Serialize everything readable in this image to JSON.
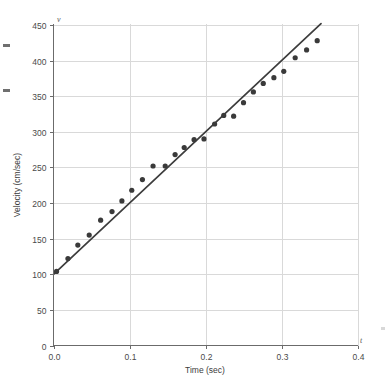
{
  "chart_data": {
    "type": "scatter",
    "title": "",
    "xlabel": "Time (sec)",
    "ylabel": "Velocity (cm/sec)",
    "x_axis_variable": "t",
    "y_axis_variable": "v",
    "xlim": [
      0.0,
      0.4
    ],
    "ylim": [
      0,
      450
    ],
    "xticks": [
      0.0,
      0.1,
      0.2,
      0.3,
      0.4
    ],
    "xtick_labels": [
      "0.0",
      "0.1",
      "0.2",
      "0.3",
      "0.4"
    ],
    "yticks": [
      0,
      50,
      100,
      150,
      200,
      250,
      300,
      350,
      400,
      450
    ],
    "ytick_labels": [
      "0",
      "50",
      "100",
      "150",
      "200",
      "250",
      "300",
      "350",
      "400",
      "450"
    ],
    "grid": true,
    "legend": "none",
    "series": [
      {
        "name": "measured velocity",
        "type": "scatter",
        "marker": "circle",
        "color": "#3a3a3a",
        "points": [
          {
            "x": 0.004,
            "y": 104
          },
          {
            "x": 0.019,
            "y": 122
          },
          {
            "x": 0.032,
            "y": 141
          },
          {
            "x": 0.047,
            "y": 155
          },
          {
            "x": 0.062,
            "y": 176
          },
          {
            "x": 0.077,
            "y": 188
          },
          {
            "x": 0.09,
            "y": 203
          },
          {
            "x": 0.103,
            "y": 218
          },
          {
            "x": 0.117,
            "y": 233
          },
          {
            "x": 0.131,
            "y": 252
          },
          {
            "x": 0.147,
            "y": 252
          },
          {
            "x": 0.16,
            "y": 268
          },
          {
            "x": 0.172,
            "y": 278
          },
          {
            "x": 0.185,
            "y": 289
          },
          {
            "x": 0.198,
            "y": 290
          },
          {
            "x": 0.212,
            "y": 311
          },
          {
            "x": 0.224,
            "y": 323
          },
          {
            "x": 0.237,
            "y": 322
          },
          {
            "x": 0.25,
            "y": 341
          },
          {
            "x": 0.263,
            "y": 356
          },
          {
            "x": 0.276,
            "y": 368
          },
          {
            "x": 0.29,
            "y": 376
          },
          {
            "x": 0.303,
            "y": 385
          },
          {
            "x": 0.318,
            "y": 404
          },
          {
            "x": 0.333,
            "y": 415
          },
          {
            "x": 0.347,
            "y": 428
          }
        ]
      },
      {
        "name": "best fit line",
        "type": "line",
        "color": "#3d3d3d",
        "endpoints": [
          {
            "x": 0.0,
            "y": 100
          },
          {
            "x": 0.352,
            "y": 452
          }
        ],
        "intercept": 100,
        "slope": 1000
      }
    ]
  }
}
